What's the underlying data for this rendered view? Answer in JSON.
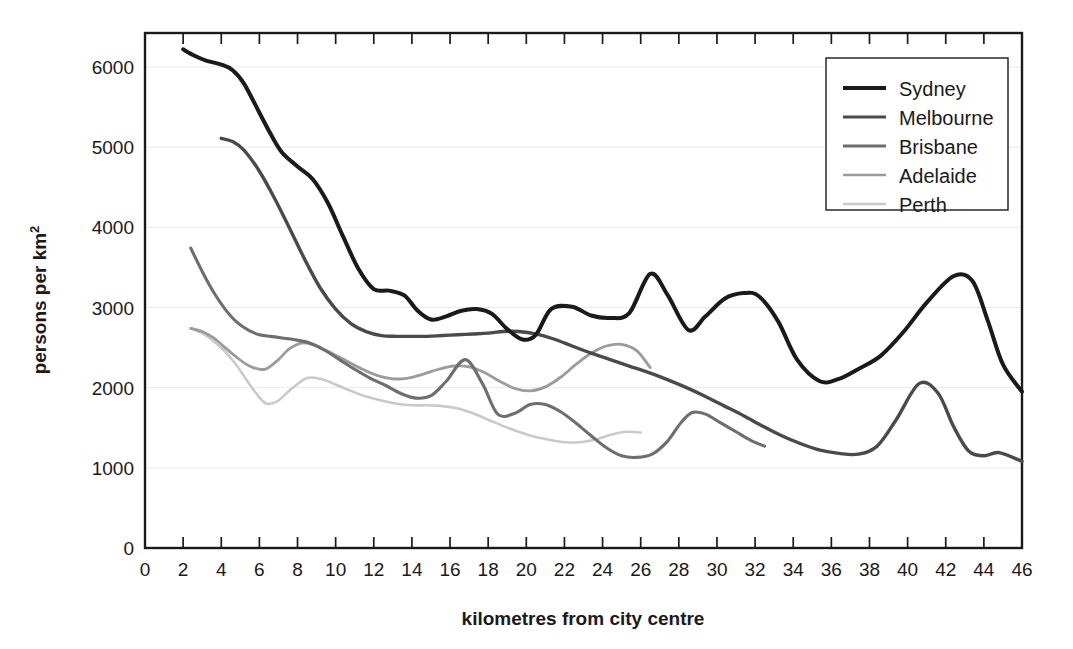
{
  "figure": {
    "background": "#ffffff",
    "axis_color": "#1a1a1a",
    "grid_color": "#e9e9ef"
  },
  "chart_data": {
    "type": "line",
    "title": "",
    "subtitle": "",
    "xlabel": "kilometres from city centre",
    "ylabel": "persons per  km²",
    "xlim": [
      0,
      46
    ],
    "ylim": [
      0,
      6500
    ],
    "grid": true,
    "grid_axis": "y",
    "legend_position": "top-right",
    "xticks": [
      0,
      2,
      4,
      6,
      8,
      10,
      12,
      14,
      16,
      18,
      20,
      22,
      24,
      26,
      28,
      30,
      32,
      34,
      36,
      38,
      40,
      42,
      44,
      46
    ],
    "xtick_labels": [
      "0",
      "2",
      "4",
      "6",
      "8",
      "10",
      "12",
      "14",
      "16",
      "18",
      "20",
      "22",
      "24",
      "26",
      "28",
      "30",
      "32",
      "34",
      "36",
      "38",
      "40",
      "42",
      "44",
      "46"
    ],
    "yticks": [
      0,
      1000,
      2000,
      3000,
      4000,
      5000,
      6000
    ],
    "ytick_labels": [
      "0",
      "1000",
      "2000",
      "3000",
      "4000",
      "5000",
      "6000"
    ],
    "series": [
      {
        "name": "Sydney",
        "color": "#1a1a1a",
        "width": 4.0,
        "x": [
          2.0,
          2.6,
          3.2,
          4.0,
          4.6,
          5.2,
          6.0,
          6.6,
          7.2,
          8.0,
          8.8,
          9.6,
          10.4,
          11.2,
          12.0,
          12.8,
          13.6,
          14.3,
          15.0,
          15.8,
          16.6,
          17.4,
          18.2,
          19.0,
          19.8,
          20.5,
          21.3,
          22.4,
          23.4,
          24.4,
          25.4,
          26.5,
          27.4,
          28.5,
          29.4,
          30.4,
          31.4,
          32.2,
          33.2,
          34.2,
          35.4,
          36.4,
          37.4,
          38.6,
          39.8,
          41.0,
          42.4,
          43.4,
          44.2,
          45.0,
          46.0
        ],
        "y": [
          6220,
          6140,
          6080,
          6030,
          5960,
          5790,
          5430,
          5160,
          4930,
          4760,
          4600,
          4300,
          3880,
          3480,
          3230,
          3210,
          3150,
          2960,
          2850,
          2890,
          2960,
          2980,
          2920,
          2730,
          2600,
          2660,
          2980,
          3010,
          2900,
          2870,
          2930,
          3420,
          3160,
          2720,
          2890,
          3110,
          3180,
          3140,
          2830,
          2350,
          2080,
          2110,
          2230,
          2400,
          2700,
          3060,
          3390,
          3330,
          2840,
          2290,
          1950
        ]
      },
      {
        "name": "Melbourne",
        "color": "#4a4a4a",
        "width": 3.4,
        "x": [
          4.0,
          4.6,
          5.2,
          6.0,
          6.8,
          7.6,
          8.4,
          9.2,
          10.0,
          10.8,
          11.6,
          12.4,
          13.2,
          14.0,
          14.8,
          15.6,
          16.4,
          17.2,
          18.0,
          18.8,
          19.6,
          20.5,
          21.4,
          22.4,
          23.4,
          24.4,
          25.4,
          26.4,
          27.4,
          28.4,
          29.4,
          30.4,
          31.4,
          32.4,
          33.4,
          34.4,
          35.4,
          36.4,
          37.4,
          38.4,
          39.4,
          40.6,
          41.6,
          42.4,
          43.2,
          44.0,
          44.8,
          46.0
        ],
        "y": [
          5110,
          5070,
          4960,
          4700,
          4360,
          3980,
          3590,
          3240,
          2980,
          2800,
          2700,
          2650,
          2640,
          2640,
          2640,
          2650,
          2660,
          2670,
          2680,
          2700,
          2700,
          2670,
          2610,
          2520,
          2430,
          2350,
          2270,
          2190,
          2100,
          2000,
          1890,
          1770,
          1650,
          1520,
          1400,
          1300,
          1220,
          1180,
          1170,
          1270,
          1600,
          2050,
          1930,
          1520,
          1210,
          1150,
          1190,
          1080
        ]
      },
      {
        "name": "Brisbane",
        "color": "#6e6e6e",
        "width": 3.1,
        "x": [
          2.4,
          3.0,
          3.6,
          4.2,
          4.8,
          5.4,
          6.0,
          6.6,
          7.2,
          7.8,
          8.6,
          9.4,
          10.2,
          11.0,
          11.8,
          12.6,
          13.4,
          14.2,
          15.0,
          15.8,
          16.8,
          17.7,
          18.5,
          19.4,
          20.2,
          21.0,
          21.8,
          22.6,
          23.4,
          24.2,
          25.0,
          25.8,
          26.6,
          27.4,
          28.1,
          28.7,
          29.4,
          30.2,
          31.0,
          31.8,
          32.5
        ],
        "y": [
          3740,
          3450,
          3190,
          2980,
          2820,
          2720,
          2660,
          2640,
          2620,
          2600,
          2560,
          2470,
          2350,
          2230,
          2120,
          2030,
          1930,
          1870,
          1900,
          2080,
          2350,
          2050,
          1670,
          1680,
          1790,
          1790,
          1700,
          1560,
          1400,
          1250,
          1150,
          1130,
          1170,
          1330,
          1560,
          1690,
          1670,
          1560,
          1450,
          1340,
          1270
        ]
      },
      {
        "name": "Adelaide",
        "color": "#9b9b9b",
        "width": 2.8,
        "x": [
          2.4,
          3.0,
          3.6,
          4.2,
          4.8,
          5.4,
          6.0,
          6.4,
          7.0,
          7.6,
          8.3,
          9.0,
          9.8,
          10.6,
          11.4,
          12.2,
          13.0,
          13.8,
          14.6,
          15.4,
          16.2,
          17.0,
          17.8,
          18.6,
          19.4,
          20.2,
          21.0,
          21.8,
          22.6,
          23.4,
          24.2,
          25.0,
          25.8,
          26.5
        ],
        "y": [
          2740,
          2700,
          2620,
          2500,
          2380,
          2280,
          2230,
          2240,
          2350,
          2490,
          2560,
          2520,
          2430,
          2330,
          2230,
          2150,
          2110,
          2120,
          2170,
          2230,
          2270,
          2260,
          2190,
          2080,
          1990,
          1960,
          2010,
          2130,
          2290,
          2430,
          2520,
          2540,
          2460,
          2250
        ]
      },
      {
        "name": "Perth",
        "color": "#c9c9c9",
        "width": 2.6,
        "x": [
          2.4,
          3.0,
          3.6,
          4.2,
          4.8,
          5.4,
          6.0,
          6.4,
          7.0,
          7.7,
          8.5,
          9.2,
          10.0,
          10.8,
          11.6,
          12.4,
          13.2,
          14.0,
          14.8,
          15.6,
          16.4,
          17.2,
          18.0,
          18.8,
          19.6,
          20.4,
          21.2,
          22.0,
          22.8,
          23.6,
          24.4,
          25.2,
          26.0
        ],
        "y": [
          2740,
          2680,
          2580,
          2450,
          2280,
          2070,
          1880,
          1800,
          1840,
          1990,
          2120,
          2110,
          2040,
          1960,
          1890,
          1840,
          1800,
          1780,
          1780,
          1770,
          1740,
          1680,
          1600,
          1520,
          1450,
          1390,
          1350,
          1320,
          1320,
          1350,
          1410,
          1450,
          1440
        ]
      }
    ]
  },
  "legend": {
    "entries": [
      {
        "label": "Sydney",
        "color": "#1a1a1a"
      },
      {
        "label": "Melbourne",
        "color": "#4a4a4a"
      },
      {
        "label": "Brisbane",
        "color": "#6e6e6e"
      },
      {
        "label": "Adelaide",
        "color": "#9b9b9b"
      },
      {
        "label": "Perth",
        "color": "#c9c9c9"
      }
    ]
  }
}
